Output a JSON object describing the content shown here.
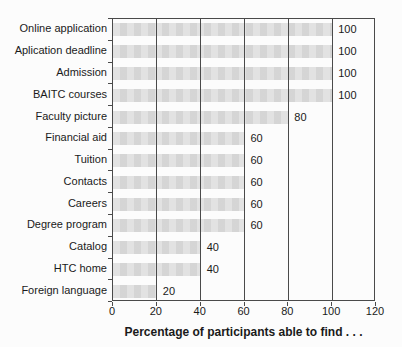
{
  "chart_data": {
    "type": "bar",
    "orientation": "horizontal",
    "title": "",
    "xlabel": "Percentage of participants able to find . . .",
    "ylabel": "",
    "categories": [
      "Online application",
      "Aplication deadline",
      "Admission",
      "BAITC courses",
      "Faculty picture",
      "Financial aid",
      "Tuition",
      "Contacts",
      "Careers",
      "Degree program",
      "Catalog",
      "HTC home",
      "Foreign language"
    ],
    "values": [
      100,
      100,
      100,
      100,
      80,
      60,
      60,
      60,
      60,
      60,
      40,
      40,
      20
    ],
    "value_labels_shown": true,
    "xlim": [
      0,
      120
    ],
    "xticks": [
      0,
      20,
      40,
      60,
      80,
      100,
      120
    ],
    "grid": "vertical-over-bars",
    "colors": {
      "bar_fill": "#dcdcdc",
      "gridline": "#4a4a4a",
      "border": "#4a4a4a",
      "text": "#1a1a1a",
      "background": "#fcfcfc"
    }
  }
}
